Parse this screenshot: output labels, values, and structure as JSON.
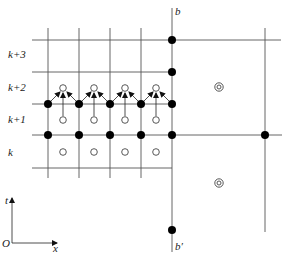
{
  "diagram": {
    "type": "finite-difference stencil grid",
    "row_labels": [
      "k+3",
      "k+2",
      "k+1",
      "k"
    ],
    "boundary_top_label": "b",
    "boundary_bottom_label": "b′",
    "axes": {
      "origin_label": "O",
      "horizontal_label": "x",
      "vertical_label": "t"
    },
    "colors": {
      "line": "#555555",
      "solid_node": "#000000",
      "open_node_stroke": "#444444",
      "background": "#ffffff"
    },
    "grid": {
      "vertical_lines_x": [
        48,
        79,
        110,
        141
      ],
      "boundary_line_x": 172,
      "right_line_x": 265,
      "horizontal_lines_y": [
        40,
        72,
        104,
        135,
        168
      ]
    },
    "solid_nodes": [
      [
        48,
        104
      ],
      [
        79,
        104
      ],
      [
        110,
        104
      ],
      [
        141,
        104
      ],
      [
        172,
        104
      ],
      [
        48,
        135
      ],
      [
        79,
        135
      ],
      [
        110,
        135
      ],
      [
        141,
        135
      ],
      [
        172,
        135
      ],
      [
        172,
        40
      ],
      [
        172,
        72
      ],
      [
        172,
        230
      ],
      [
        265,
        135
      ]
    ],
    "open_nodes": [
      [
        63,
        88
      ],
      [
        94,
        88
      ],
      [
        125,
        88
      ],
      [
        156,
        88
      ],
      [
        63,
        120
      ],
      [
        94,
        120
      ],
      [
        125,
        120
      ],
      [
        156,
        120
      ],
      [
        63,
        152
      ],
      [
        94,
        152
      ],
      [
        125,
        152
      ],
      [
        156,
        152
      ]
    ],
    "double_circle_nodes": [
      [
        219,
        87
      ],
      [
        219,
        183
      ]
    ],
    "arrows": "each open node at row k+2 receives arrows from the two solid nodes below-left and below-right and from the open node directly below"
  }
}
